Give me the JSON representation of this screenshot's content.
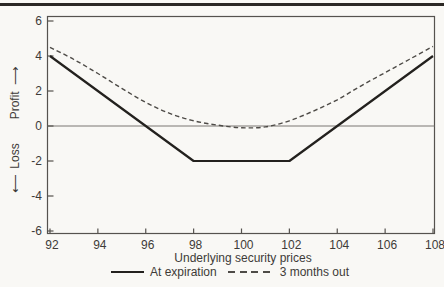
{
  "colors": {
    "background": "#f9f8f5",
    "top_rule": "#2b2825",
    "frame": "#55524e",
    "zero_line": "#7a7772",
    "text": "#3e3b38",
    "solid_series": "#23211e",
    "dashed_series": "#4e4b47"
  },
  "chart_data": {
    "type": "line",
    "title": "",
    "xlabel": "Underlying security prices",
    "ylabel": {
      "loss_arrow": "⟵",
      "loss": "Loss",
      "profit": "Profit",
      "profit_arrow": "⟶"
    },
    "xlim": [
      92,
      108
    ],
    "ylim": [
      -6,
      6
    ],
    "x_ticks": [
      92,
      94,
      96,
      98,
      100,
      102,
      104,
      106,
      108
    ],
    "y_ticks": [
      6,
      4,
      2,
      0,
      -2,
      -4,
      -6
    ],
    "grid": "zero-line-only",
    "legend_position": "bottom-center",
    "series": [
      {
        "name": "At expiration",
        "line_style": "solid",
        "color": "#23211e",
        "stroke_width": 2.2,
        "points": [
          [
            92,
            4
          ],
          [
            98,
            -2
          ],
          [
            102,
            -2
          ],
          [
            108,
            4
          ]
        ]
      },
      {
        "name": "3 months out",
        "line_style": "dashed",
        "color": "#4e4b47",
        "stroke_width": 1.4,
        "points": [
          [
            92,
            4.5
          ],
          [
            93,
            3.8
          ],
          [
            94,
            3.0
          ],
          [
            95,
            2.15
          ],
          [
            96,
            1.35
          ],
          [
            97,
            0.72
          ],
          [
            98,
            0.3
          ],
          [
            99,
            0.05
          ],
          [
            100,
            -0.1
          ],
          [
            101,
            -0.05
          ],
          [
            102,
            0.3
          ],
          [
            103,
            0.85
          ],
          [
            104,
            1.5
          ],
          [
            105,
            2.3
          ],
          [
            106,
            3.05
          ],
          [
            107,
            3.8
          ],
          [
            108,
            4.55
          ]
        ]
      }
    ]
  }
}
